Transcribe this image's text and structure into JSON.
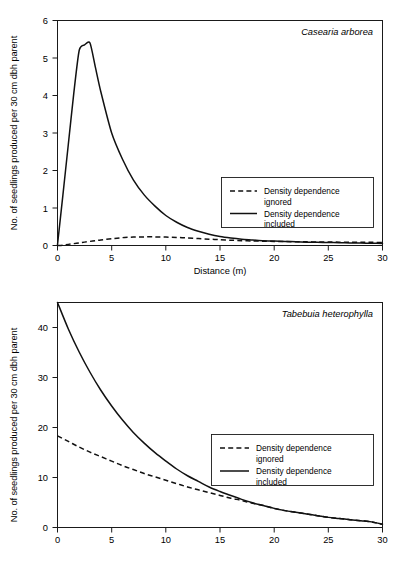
{
  "figure": {
    "panels": [
      {
        "id": "casearia",
        "species": "Casearia arborea",
        "xlabel": "Distance (m)",
        "ylabel": "No. of seedlings produced per 30 cm dbh parent",
        "xticks": [
          "0",
          "5",
          "10",
          "15",
          "20",
          "25",
          "30"
        ],
        "yticks": [
          "0",
          "1",
          "2",
          "3",
          "4",
          "5",
          "6"
        ],
        "legend": [
          {
            "label_line1": "Density dependence",
            "label_line2": "ignored",
            "style": "dashed"
          },
          {
            "label_line1": "Density dependence",
            "label_line2": "included",
            "style": "solid"
          }
        ]
      },
      {
        "id": "tabebuia",
        "species": "Tabebuia heterophylla",
        "xlabel": "Distance (m)",
        "ylabel": "No. of seedlings produced per 30 cm dbh parent",
        "xticks": [
          "0",
          "5",
          "10",
          "15",
          "20",
          "25",
          "30"
        ],
        "yticks": [
          "0",
          "10",
          "20",
          "30",
          "40"
        ],
        "legend": [
          {
            "label_line1": "Density dependence",
            "label_line2": "ignored",
            "style": "dashed"
          },
          {
            "label_line1": "Density dependence",
            "label_line2": "included",
            "style": "solid"
          }
        ]
      }
    ]
  },
  "chart_data": [
    {
      "type": "line",
      "title": "Casearia arborea",
      "xlabel": "Distance (m)",
      "ylabel": "No. of seedlings produced per 30 cm dbh parent",
      "xlim": [
        0,
        30
      ],
      "ylim": [
        0,
        6
      ],
      "xticks": [
        0,
        5,
        10,
        15,
        20,
        25,
        30
      ],
      "yticks": [
        0,
        1,
        2,
        3,
        4,
        5,
        6
      ],
      "grid": false,
      "legend_position": "center-right",
      "x": [
        0,
        0.5,
        1,
        1.5,
        2,
        2.5,
        3,
        3.5,
        4,
        5,
        6,
        7,
        8,
        9,
        10,
        11,
        12,
        13,
        14,
        15,
        16,
        17,
        18,
        19,
        20,
        21,
        22,
        23,
        24,
        25,
        26,
        27,
        28,
        29,
        30
      ],
      "series": [
        {
          "name": "Density dependence included",
          "style": "solid",
          "values": [
            0.02,
            1.35,
            2.7,
            4.05,
            5.2,
            5.35,
            5.4,
            4.75,
            4.1,
            3.0,
            2.3,
            1.75,
            1.35,
            1.05,
            0.8,
            0.62,
            0.48,
            0.38,
            0.3,
            0.24,
            0.2,
            0.17,
            0.15,
            0.13,
            0.12,
            0.11,
            0.1,
            0.09,
            0.085,
            0.08,
            0.075,
            0.07,
            0.065,
            0.06,
            0.055
          ]
        },
        {
          "name": "Density dependence ignored",
          "style": "dashed",
          "values": [
            0.0,
            0.01,
            0.03,
            0.05,
            0.07,
            0.09,
            0.11,
            0.13,
            0.15,
            0.18,
            0.21,
            0.225,
            0.23,
            0.23,
            0.225,
            0.215,
            0.2,
            0.185,
            0.17,
            0.155,
            0.14,
            0.13,
            0.12,
            0.115,
            0.11,
            0.105,
            0.1,
            0.098,
            0.095,
            0.092,
            0.09,
            0.088,
            0.086,
            0.084,
            0.082
          ]
        }
      ]
    },
    {
      "type": "line",
      "title": "Tabebuia heterophylla",
      "xlabel": "Distance (m)",
      "ylabel": "No. of seedlings produced per 30 cm dbh parent",
      "xlim": [
        0,
        30
      ],
      "ylim": [
        0,
        40
      ],
      "xticks": [
        0,
        5,
        10,
        15,
        20,
        25,
        30
      ],
      "yticks": [
        0,
        10,
        20,
        30,
        40
      ],
      "grid": false,
      "legend_position": "center-right",
      "x": [
        0,
        1,
        2,
        3,
        4,
        5,
        6,
        7,
        8,
        9,
        10,
        11,
        12,
        13,
        14,
        15,
        16,
        17,
        18,
        19,
        20,
        21,
        22,
        23,
        24,
        25,
        26,
        27,
        28,
        29,
        30
      ],
      "series": [
        {
          "name": "Density dependence included",
          "style": "solid",
          "values": [
            40.0,
            35.3,
            31.2,
            27.6,
            24.4,
            21.6,
            19.1,
            16.9,
            15.0,
            13.3,
            11.8,
            10.4,
            9.2,
            8.2,
            7.2,
            6.4,
            5.7,
            5.0,
            4.4,
            3.9,
            3.4,
            3.0,
            2.7,
            2.4,
            2.1,
            1.8,
            1.6,
            1.4,
            1.2,
            1.0,
            0.6
          ]
        },
        {
          "name": "Density dependence ignored",
          "style": "dashed",
          "values": [
            16.3,
            15.3,
            14.3,
            13.4,
            12.6,
            11.8,
            11.0,
            10.3,
            9.6,
            9.0,
            8.4,
            7.8,
            7.2,
            6.7,
            6.2,
            5.7,
            5.2,
            4.8,
            4.3,
            3.9,
            3.4,
            3.0,
            2.7,
            2.4,
            2.1,
            1.8,
            1.6,
            1.4,
            1.2,
            1.0,
            0.55
          ]
        }
      ]
    }
  ]
}
